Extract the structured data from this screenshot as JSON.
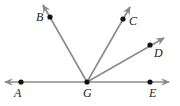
{
  "diagram": {
    "type": "geometry-rays",
    "vertex": {
      "label": "G",
      "x": 87,
      "y": 82
    },
    "line": {
      "from": [
        5,
        82
      ],
      "to": [
        169,
        82
      ],
      "points": [
        "A",
        "G",
        "E"
      ]
    },
    "points": [
      {
        "label": "A",
        "x": 21,
        "y": 82,
        "lx": 14,
        "ly": 97
      },
      {
        "label": "E",
        "x": 150,
        "y": 82,
        "lx": 149,
        "ly": 97
      },
      {
        "label": "G",
        "x": 87,
        "y": 82,
        "lx": 83,
        "ly": 97
      },
      {
        "label": "B",
        "x": 50,
        "y": 17,
        "lx": 36,
        "ly": 21
      },
      {
        "label": "C",
        "x": 123,
        "y": 19,
        "lx": 129,
        "ly": 25
      },
      {
        "label": "D",
        "x": 150,
        "y": 45,
        "lx": 154,
        "ly": 57
      }
    ],
    "rays": [
      {
        "name": "GB",
        "end": [
          43,
          5
        ]
      },
      {
        "name": "GC",
        "end": [
          130,
          7
        ]
      },
      {
        "name": "GD",
        "end": [
          164,
          38
        ]
      }
    ],
    "colors": {
      "line": "#8a8a8a",
      "arrow": "#8a8a8a",
      "dot": "#111111",
      "label": "#222222"
    }
  }
}
